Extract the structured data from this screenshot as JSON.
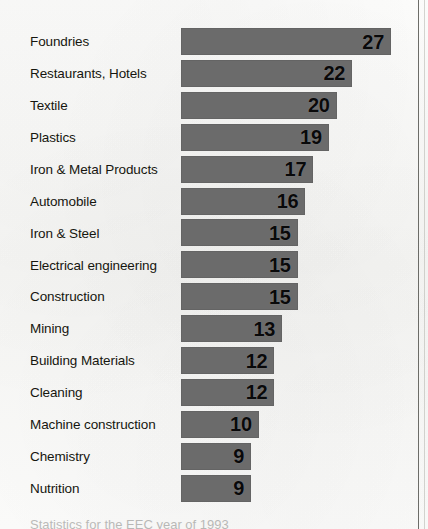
{
  "chart_data": {
    "type": "bar",
    "orientation": "horizontal",
    "title": "",
    "subtitle": "",
    "xlabel": "",
    "ylabel": "",
    "grid": false,
    "legend": null,
    "xlim": [
      0,
      27
    ],
    "value_labels_shown": true,
    "value_label_position": "inside-right",
    "categories": [
      "Foundries",
      "Restaurants, Hotels",
      "Textile",
      "Plastics",
      "Iron & Metal Products",
      "Automobile",
      "Iron & Steel",
      "Electrical engineering",
      "Construction",
      "Mining",
      "Building Materials",
      "Cleaning",
      "Machine construction",
      "Chemistry",
      "Nutrition"
    ],
    "values": [
      27,
      22,
      20,
      19,
      17,
      16,
      15,
      15,
      15,
      13,
      12,
      12,
      10,
      9,
      9
    ],
    "bar_color": "#6b6b6b",
    "value_label_color": "#09090a",
    "category_label_color": "#16160f",
    "background_color": "#fbfbfa"
  },
  "caption": {
    "text": "Statistics for the EEC year of 1993"
  }
}
